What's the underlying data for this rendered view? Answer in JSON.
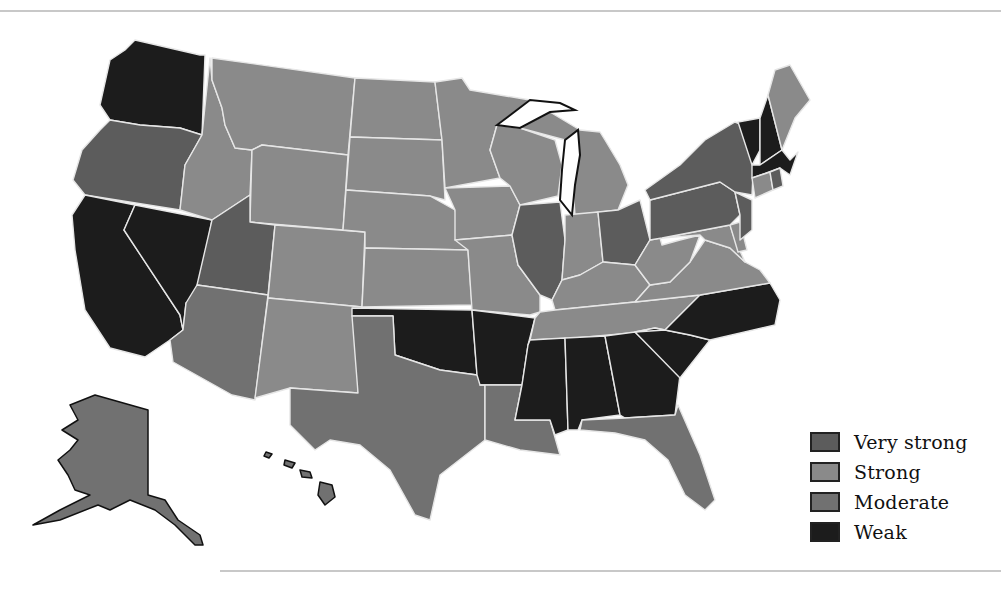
{
  "map": {
    "title": "",
    "type": "choropleth",
    "region": "United States",
    "colors": {
      "very_strong": "#5c5c5c",
      "strong": "#8a8a8a",
      "moderate": "#717171",
      "weak": "#1c1c1c",
      "border": "#e6e6e6",
      "coast": "#111111"
    },
    "states": {
      "WA": "weak",
      "OR": "very_strong",
      "CA": "weak",
      "NV": "weak",
      "ID": "strong",
      "MT": "strong",
      "WY": "strong",
      "UT": "very_strong",
      "AZ": "moderate",
      "CO": "strong",
      "NM": "strong",
      "ND": "strong",
      "SD": "strong",
      "NE": "strong",
      "KS": "strong",
      "OK": "weak",
      "TX": "moderate",
      "MN": "strong",
      "IA": "strong",
      "MO": "strong",
      "AR": "weak",
      "LA": "moderate",
      "WI": "strong",
      "IL": "very_strong",
      "MI": "strong",
      "IN": "strong",
      "OH": "very_strong",
      "KY": "strong",
      "TN": "strong",
      "MS": "weak",
      "AL": "weak",
      "GA": "weak",
      "FL": "moderate",
      "SC": "weak",
      "NC": "weak",
      "VA": "strong",
      "WV": "strong",
      "MD": "strong",
      "DE": "strong",
      "PA": "very_strong",
      "NJ": "very_strong",
      "NY": "very_strong",
      "CT": "strong",
      "RI": "very_strong",
      "MA": "weak",
      "VT": "weak",
      "NH": "weak",
      "ME": "strong",
      "AK": "moderate",
      "HI": "moderate"
    }
  },
  "legend": {
    "items": [
      {
        "key": "very_strong",
        "label": "Very strong",
        "color": "#5c5c5c"
      },
      {
        "key": "strong",
        "label": "Strong",
        "color": "#8a8a8a"
      },
      {
        "key": "moderate",
        "label": "Moderate",
        "color": "#717171"
      },
      {
        "key": "weak",
        "label": "Weak",
        "color": "#1c1c1c"
      }
    ]
  }
}
